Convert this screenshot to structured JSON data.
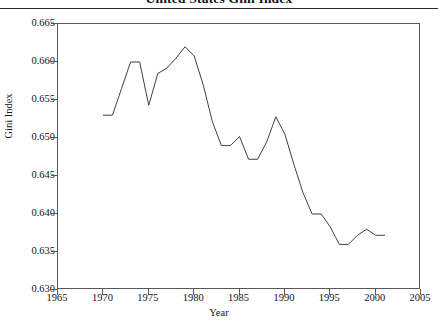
{
  "chart_data": {
    "type": "line",
    "title": "United States Gini Index",
    "xlabel": "Year",
    "ylabel": "Gini Index",
    "xlim": [
      1965,
      2005
    ],
    "ylim": [
      0.63,
      0.665
    ],
    "xticks": [
      1965,
      1970,
      1975,
      1980,
      1985,
      1990,
      1995,
      2000,
      2005
    ],
    "xtick_labels": [
      "1965",
      "1970",
      "1975",
      "1980",
      "1985",
      "1990",
      "1995",
      "2000",
      "2005"
    ],
    "yticks": [
      0.63,
      0.635,
      0.64,
      0.645,
      0.65,
      0.655,
      0.66,
      0.665
    ],
    "ytick_labels": [
      "0.630",
      "0.635",
      "0.640",
      "0.645",
      "0.650",
      "0.655",
      "0.660",
      "0.665"
    ],
    "grid": false,
    "legend": false,
    "line_color": "#3f3f3f",
    "line_width": 1,
    "x": [
      1970,
      1971,
      1972,
      1973,
      1974,
      1975,
      1976,
      1977,
      1978,
      1979,
      1980,
      1981,
      1982,
      1983,
      1984,
      1985,
      1986,
      1987,
      1988,
      1989,
      1990,
      1991,
      1992,
      1993,
      1994,
      1995,
      1996,
      1997,
      1998,
      1999,
      2000,
      2001
    ],
    "values": [
      0.653,
      0.653,
      0.6565,
      0.66,
      0.66,
      0.6543,
      0.6585,
      0.6592,
      0.6605,
      0.662,
      0.6608,
      0.657,
      0.6522,
      0.649,
      0.649,
      0.6502,
      0.6472,
      0.6472,
      0.6495,
      0.6528,
      0.6505,
      0.6465,
      0.6428,
      0.64,
      0.64,
      0.6383,
      0.636,
      0.636,
      0.6372,
      0.638,
      0.6372,
      0.6372
    ],
    "series": [
      {
        "name": "Gini Index",
        "values": [
          0.653,
          0.653,
          0.6565,
          0.66,
          0.66,
          0.6543,
          0.6585,
          0.6592,
          0.6605,
          0.662,
          0.6608,
          0.657,
          0.6522,
          0.649,
          0.649,
          0.6502,
          0.6472,
          0.6472,
          0.6495,
          0.6528,
          0.6505,
          0.6465,
          0.6428,
          0.64,
          0.64,
          0.6383,
          0.636,
          0.636,
          0.6372,
          0.638,
          0.6372,
          0.6372
        ]
      }
    ]
  }
}
